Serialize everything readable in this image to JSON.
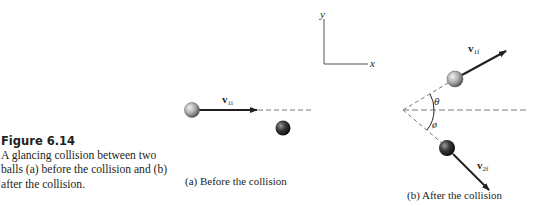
{
  "figure": {
    "label": "Figure 6.14",
    "caption": "A glancing collision between two balls (a) before the collision and (b) after the collision."
  },
  "axes": {
    "y_label": "y",
    "x_label": "x"
  },
  "panel_a": {
    "caption": "(a) Before the collision",
    "velocity_label_main": "v",
    "velocity_label_sub": "1i"
  },
  "panel_b": {
    "caption": "(b) After the collision",
    "v1f_main": "v",
    "v1f_sub": "1f",
    "v2f_main": "v",
    "v2f_sub": "2f",
    "theta": "θ",
    "phi": "ø"
  },
  "colors": {
    "ink": "#231f20",
    "ball1_light": "#e6e6e6",
    "ball1_dark": "#6e6e6e",
    "ball2_light": "#8a8a8a",
    "ball2_dark": "#141414",
    "dash": "#7a7a7a"
  }
}
